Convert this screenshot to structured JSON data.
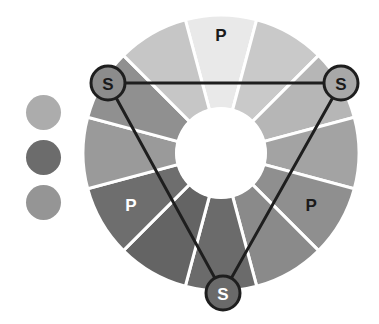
{
  "diagram": {
    "center": [
      221,
      153
    ],
    "outer_radius": 138,
    "inner_radius": 46,
    "segments": [
      {
        "index": 0,
        "angle": 0,
        "color": "#e9e9e9",
        "label": "P",
        "label_color": "#1a1a1a"
      },
      {
        "index": 1,
        "angle": 30,
        "color": "#c9c9c9",
        "label": "",
        "label_color": ""
      },
      {
        "index": 2,
        "angle": 60,
        "color": "#b6b6b6",
        "label": "",
        "label_color": ""
      },
      {
        "index": 3,
        "angle": 90,
        "color": "#a3a3a3",
        "label": "",
        "label_color": ""
      },
      {
        "index": 4,
        "angle": 120,
        "color": "#8f8f8f",
        "label": "P",
        "label_color": "#1a1a1a"
      },
      {
        "index": 5,
        "angle": 150,
        "color": "#8a8a8a",
        "label": "",
        "label_color": ""
      },
      {
        "index": 6,
        "angle": 180,
        "color": "#6b6b6b",
        "label": "",
        "label_color": ""
      },
      {
        "index": 7,
        "angle": 210,
        "color": "#646464",
        "label": "",
        "label_color": ""
      },
      {
        "index": 8,
        "angle": 240,
        "color": "#6e6e6e",
        "label": "P",
        "label_color": "#ffffff"
      },
      {
        "index": 9,
        "angle": 270,
        "color": "#9a9a9a",
        "label": "",
        "label_color": ""
      },
      {
        "index": 10,
        "angle": 300,
        "color": "#909090",
        "label": "",
        "label_color": ""
      },
      {
        "index": 11,
        "angle": 330,
        "color": "#c6c6c6",
        "label": "",
        "label_color": ""
      }
    ],
    "secondary_nodes": [
      {
        "id": "left",
        "x": 108,
        "y": 83,
        "r": 17,
        "fill": "#8c8c8c",
        "label": "S",
        "label_color": "#1a1a1a"
      },
      {
        "id": "right",
        "x": 341,
        "y": 83,
        "r": 17,
        "fill": "#a8a8a8",
        "label": "S",
        "label_color": "#1a1a1a"
      },
      {
        "id": "bottom",
        "x": 223,
        "y": 293,
        "r": 17,
        "fill": "#6a6a6a",
        "label": "S",
        "label_color": "#ffffff"
      }
    ],
    "triangle_color": "#1e1e1e",
    "legend": [
      {
        "color": "#acacac"
      },
      {
        "color": "#6c6c6c"
      },
      {
        "color": "#959595"
      }
    ]
  }
}
